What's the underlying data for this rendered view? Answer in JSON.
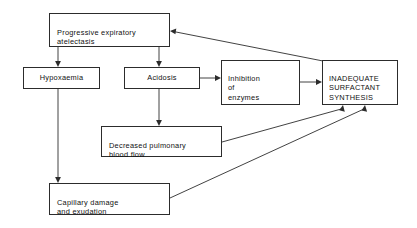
{
  "diagram": {
    "type": "flowchart",
    "background_color": "#ffffff",
    "line_color": "#2c2c2c",
    "text_color": "#111111",
    "nodes": [
      {
        "id": "atelectasis",
        "label": "Progressive expiratory\natelectasis",
        "x": 49,
        "y": 13,
        "width": 121,
        "height": 34,
        "align": "left"
      },
      {
        "id": "hypoxaemia",
        "label": "Hypoxaemia",
        "x": 23,
        "y": 67,
        "width": 77,
        "height": 22,
        "align": "center"
      },
      {
        "id": "acidosis",
        "label": "Acidosis",
        "x": 124,
        "y": 67,
        "width": 76,
        "height": 22,
        "align": "center"
      },
      {
        "id": "inhibition",
        "label": "Inhibition\nof\nenzymes",
        "x": 221,
        "y": 60,
        "width": 79,
        "height": 45,
        "align": "left"
      },
      {
        "id": "inadequate",
        "label": "INADEQUATE\nSURFACTANT\nSYNTHESIS",
        "x": 322,
        "y": 60,
        "width": 76,
        "height": 45,
        "align": "left"
      },
      {
        "id": "decreased-flow",
        "label": "Decreased pulmonary\nblood flow",
        "x": 101,
        "y": 126,
        "width": 121,
        "height": 31,
        "align": "left"
      },
      {
        "id": "capillary",
        "label": "Capillary damage\nand exudation",
        "x": 49,
        "y": 183,
        "width": 121,
        "height": 32,
        "align": "left"
      }
    ],
    "edges": [
      {
        "id": "atelectasis-to-hypoxaemia",
        "from": "atelectasis",
        "to": "hypoxaemia",
        "kind": "vertical-arrow"
      },
      {
        "id": "atelectasis-to-acidosis",
        "from": "atelectasis",
        "to": "acidosis",
        "kind": "vertical-arrow"
      },
      {
        "id": "hypoxaemia-to-capillary",
        "from": "hypoxaemia",
        "to": "capillary",
        "kind": "vertical-arrow"
      },
      {
        "id": "acidosis-to-decreased-flow",
        "from": "acidosis",
        "to": "decreased-flow",
        "kind": "vertical-arrow"
      },
      {
        "id": "acidosis-to-inhibition",
        "from": "acidosis",
        "to": "inhibition",
        "kind": "horizontal-arrow"
      },
      {
        "id": "inhibition-to-inadequate",
        "from": "inhibition",
        "to": "inadequate",
        "kind": "horizontal-arrow"
      },
      {
        "id": "decreased-flow-to-inadequate",
        "from": "decreased-flow",
        "to": "inadequate",
        "kind": "diagonal-arrow"
      },
      {
        "id": "capillary-to-inadequate",
        "from": "capillary",
        "to": "inadequate",
        "kind": "diagonal-arrow"
      },
      {
        "id": "inadequate-to-atelectasis",
        "from": "inadequate",
        "to": "atelectasis",
        "kind": "feedback-diagonal-arrow"
      }
    ]
  }
}
